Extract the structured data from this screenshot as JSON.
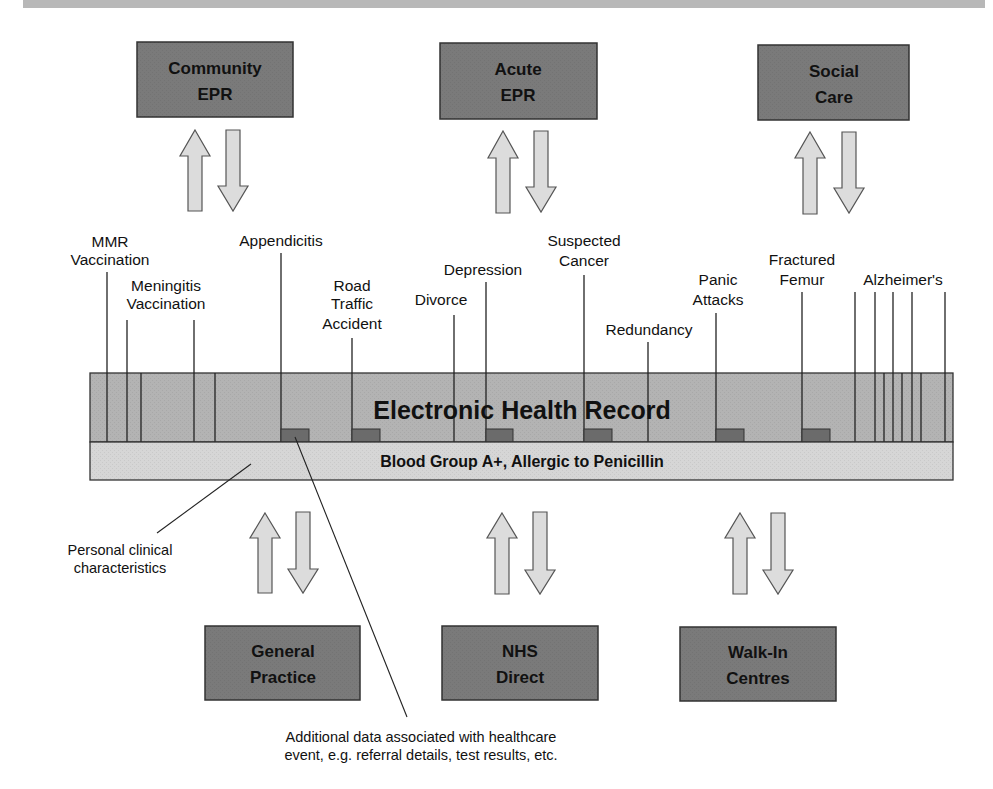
{
  "colors": {
    "box_fill": "#7a7a7a",
    "box_stroke": "#333333",
    "ehr_fill": "#b3b3b3",
    "blood_fill": "#d6d6d6",
    "arrow_fill": "#dcdcdc",
    "marker_fill": "#6b6b6b",
    "top_bar": "#b8b8b8"
  },
  "top_systems": [
    {
      "id": "community-epr",
      "line1": "Community",
      "line2": "EPR"
    },
    {
      "id": "acute-epr",
      "line1": "Acute",
      "line2": "EPR"
    },
    {
      "id": "social-care",
      "line1": "Social",
      "line2": "Care"
    }
  ],
  "bottom_systems": [
    {
      "id": "general-practice",
      "line1": "General",
      "line2": "Practice"
    },
    {
      "id": "nhs-direct",
      "line1": "NHS",
      "line2": "Direct"
    },
    {
      "id": "walk-in-centres",
      "line1": "Walk-In",
      "line2": "Centres"
    }
  ],
  "events": [
    {
      "line1": "MMR",
      "line2": "Vaccination"
    },
    {
      "line1": "Meningitis",
      "line2": "Vaccination"
    },
    {
      "line1": "Appendicitis"
    },
    {
      "line1": "Road",
      "line2": "Traffic",
      "line3": "Accident"
    },
    {
      "line1": "Divorce"
    },
    {
      "line1": "Depression"
    },
    {
      "line1": "Suspected",
      "line2": "Cancer"
    },
    {
      "line1": "Redundancy"
    },
    {
      "line1": "Panic",
      "line2": "Attacks"
    },
    {
      "line1": "Fractured",
      "line2": "Femur"
    },
    {
      "line1": "Alzheimer's"
    }
  ],
  "ehr": {
    "title": "Electronic Health Record",
    "blood_group": "Blood Group A+, Allergic to Penicillin"
  },
  "annotations": {
    "personal_line1": "Personal clinical",
    "personal_line2": "characteristics",
    "additional_line1": "Additional data associated with healthcare",
    "additional_line2": "event, e.g. referral details, test results, etc."
  }
}
